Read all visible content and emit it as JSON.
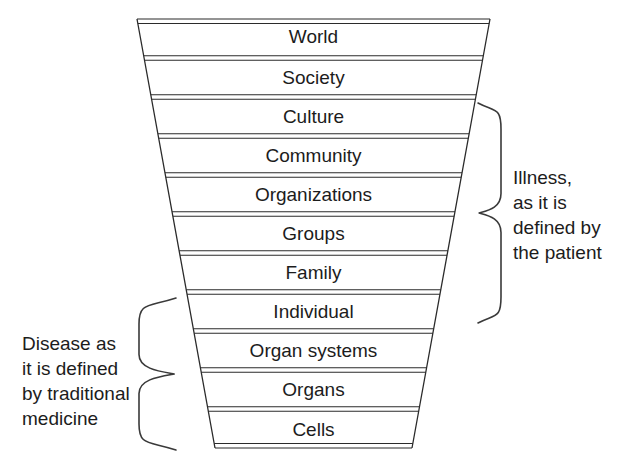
{
  "diagram": {
    "background_color": "#ffffff",
    "line_color": "#2b2b2b",
    "text_color": "#1c1c1c",
    "geometry": {
      "top_left_x": 137,
      "top_right_x": 490,
      "bottom_left_x": 215,
      "bottom_right_x": 412,
      "top_y": 19,
      "bottom_y": 448,
      "divider_gap": 4.5
    },
    "tiers": [
      {
        "label": "World"
      },
      {
        "label": "Society"
      },
      {
        "label": "Culture"
      },
      {
        "label": "Community"
      },
      {
        "label": "Organizations"
      },
      {
        "label": "Groups"
      },
      {
        "label": "Family"
      },
      {
        "label": "Individual"
      },
      {
        "label": "Organ systems"
      },
      {
        "label": "Organs"
      },
      {
        "label": "Cells"
      }
    ],
    "annotations": {
      "right": {
        "text": "Illness,\nas it is\ndefined by\nthe patient",
        "brace_side": "left-pointing",
        "spans_tiers": [
          "Culture",
          "Individual"
        ],
        "brace_top_y": 103,
        "brace_bottom_y": 323,
        "brace_arm_x": 478,
        "brace_tip_x": 501
      },
      "left": {
        "text": "Disease as\nit is defined\nby traditional\nmedicine",
        "brace_side": "right-pointing",
        "spans_tiers": [
          "Individual",
          "Cells"
        ],
        "brace_top_y": 298,
        "brace_bottom_y": 450,
        "brace_arm_x": 176,
        "brace_tip_x": 139
      }
    }
  }
}
